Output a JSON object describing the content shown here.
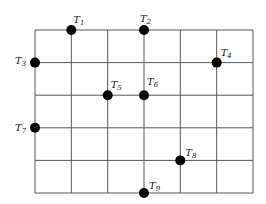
{
  "diagram": {
    "type": "grid-with-points",
    "grid": {
      "columns": 6,
      "rows": 5,
      "x_lines": [
        35,
        71.3,
        107.7,
        144,
        180.3,
        216.7,
        253
      ],
      "y_lines": [
        30,
        62.6,
        95.2,
        127.8,
        160.4,
        193
      ],
      "line_color": "#555555",
      "line_width": 1
    },
    "point_color": "#000000",
    "point_radius": 5,
    "points": [
      {
        "id": "T1",
        "base": "T",
        "sub": "1",
        "col": 1,
        "row": 0,
        "label_dx": 2,
        "label_dy": -7
      },
      {
        "id": "T2",
        "base": "T",
        "sub": "2",
        "col": 3,
        "row": 0,
        "label_dx": -4,
        "label_dy": -8
      },
      {
        "id": "T3",
        "base": "T",
        "sub": "3",
        "col": 0,
        "row": 1,
        "label_dx": -20,
        "label_dy": 1
      },
      {
        "id": "T4",
        "base": "T",
        "sub": "4",
        "col": 5,
        "row": 1,
        "label_dx": 4,
        "label_dy": -7
      },
      {
        "id": "T5",
        "base": "T",
        "sub": "5",
        "col": 2,
        "row": 2,
        "label_dx": 3,
        "label_dy": -7
      },
      {
        "id": "T6",
        "base": "T",
        "sub": "6",
        "col": 3,
        "row": 2,
        "label_dx": 3,
        "label_dy": -10
      },
      {
        "id": "T7",
        "base": "T",
        "sub": "7",
        "col": 0,
        "row": 3,
        "label_dx": -20,
        "label_dy": 3
      },
      {
        "id": "T8",
        "base": "T",
        "sub": "8",
        "col": 4,
        "row": 4,
        "label_dx": 5,
        "label_dy": -4
      },
      {
        "id": "T9",
        "base": "T",
        "sub": "9",
        "col": 3,
        "row": 5,
        "label_dx": 5,
        "label_dy": -4
      }
    ]
  }
}
